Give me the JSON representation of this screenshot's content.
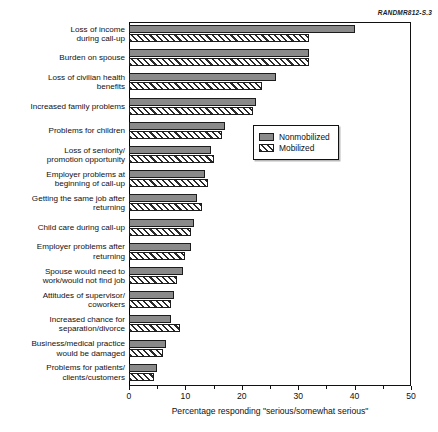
{
  "source_id": "RANDMR812-S.3",
  "chart_data": {
    "type": "bar",
    "orientation": "horizontal",
    "title": "",
    "xlabel": "Percentage responding \"serious/somewhat serious\"",
    "ylabel": "",
    "xlim": [
      0,
      50
    ],
    "xticks": [
      0,
      10,
      20,
      30,
      40,
      50
    ],
    "xtick_labels": [
      "0",
      "10",
      "20",
      "30",
      "40",
      "50"
    ],
    "minor_tick_step": 5,
    "grid": false,
    "legend_position": "upper right",
    "categories": [
      "Loss of income during call-up",
      "Burden on spouse",
      "Loss of civilian health benefits",
      "Increased family problems",
      "Problems for children",
      "Loss of seniority/promotion opportunity",
      "Employer problems at beginning of call-up",
      "Getting the same job after returning",
      "Child care during call-up",
      "Employer problems after returning",
      "Spouse would need to work/would not find job",
      "Attitudes of supervisor/coworkers",
      "Increased chance for separation/divorce",
      "Business/medical practice would be damaged",
      "Problems for patients/clients/customers"
    ],
    "category_lines": [
      [
        "Loss of income",
        "during call-up"
      ],
      [
        "Burden on spouse"
      ],
      [
        "Loss of civilian health",
        "benefits"
      ],
      [
        "Increased family problems"
      ],
      [
        "Problems for children"
      ],
      [
        "Loss of seniority/",
        "promotion opportunity"
      ],
      [
        "Employer problems at",
        "beginning of call-up"
      ],
      [
        "Getting the same job after",
        "returning"
      ],
      [
        "Child care during call-up"
      ],
      [
        "Employer problems after",
        "returning"
      ],
      [
        "Spouse would need to",
        "work/would not find job"
      ],
      [
        "Attitudes of supervisor/",
        "coworkers"
      ],
      [
        "Increased chance for",
        "separation/divorce"
      ],
      [
        "Business/medical practice",
        "would be damaged"
      ],
      [
        "Problems for patients/",
        "clients/customers"
      ]
    ],
    "series": [
      {
        "name": "Nonmobilized",
        "color": "#8a8a8a",
        "pattern": "solid",
        "values": [
          40.0,
          32.0,
          26.0,
          22.5,
          17.0,
          14.5,
          13.5,
          12.0,
          11.5,
          11.0,
          9.5,
          8.0,
          7.5,
          6.5,
          5.0
        ]
      },
      {
        "name": "Mobilized",
        "color": "#ffffff",
        "pattern": "diagonal-hatch",
        "values": [
          32.0,
          32.0,
          23.5,
          22.0,
          16.5,
          15.0,
          14.0,
          13.0,
          11.0,
          10.0,
          8.5,
          7.5,
          9.0,
          6.0,
          4.5
        ]
      }
    ]
  },
  "legend": {
    "items": [
      {
        "label": "Nonmobilized"
      },
      {
        "label": "Mobilized"
      }
    ]
  }
}
